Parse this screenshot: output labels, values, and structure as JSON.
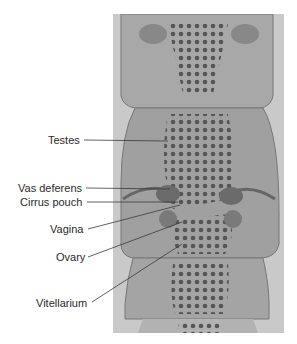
{
  "figure": {
    "type": "labeled micrograph",
    "labels": [
      {
        "text": "Testes",
        "x": 48,
        "y": 140,
        "tx": 168,
        "ty": 141
      },
      {
        "text": "Vas deferens",
        "x": 18,
        "y": 182,
        "tx": 170,
        "ty": 189
      },
      {
        "text": "Cirrus pouch",
        "x": 19,
        "y": 196,
        "tx": 178,
        "ty": 196
      },
      {
        "text": "Vagina",
        "x": 51,
        "y": 224,
        "tx": 180,
        "ty": 203
      },
      {
        "text": "Ovary",
        "x": 55,
        "y": 253,
        "tx": 180,
        "ty": 222
      },
      {
        "text": "Vitellarium",
        "x": 38,
        "y": 297,
        "tx": 182,
        "ty": 244
      }
    ]
  },
  "colors": {
    "background": "#ffffff",
    "photo_bg": "#c9c9c9",
    "segment": "#a6a6a6",
    "dots": "#555555",
    "text": "#2a2a2a",
    "leader": "#3a3a3a"
  }
}
